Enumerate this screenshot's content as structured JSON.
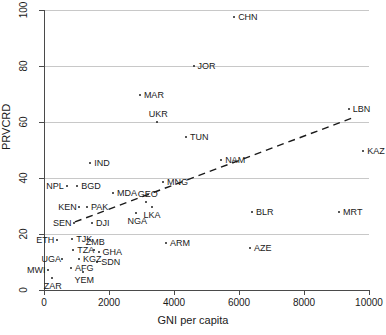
{
  "chart_data": {
    "type": "scatter",
    "title": "",
    "xlabel": "GNI per capita",
    "ylabel": "PRVCRD",
    "xlim": [
      0,
      10000
    ],
    "ylim": [
      0,
      100
    ],
    "xticks": [
      "0",
      "2000",
      "4000",
      "6000",
      "8000",
      "10000"
    ],
    "xtick_values": [
      0,
      2000,
      4000,
      6000,
      8000,
      10000
    ],
    "yticks": [
      "0",
      "20",
      "40",
      "60",
      "80",
      "100"
    ],
    "ytick_values": [
      0,
      20,
      40,
      60,
      80,
      100
    ],
    "grid": "horizontal",
    "legend": "none",
    "points": [
      {
        "label": "CHN",
        "x": 5850,
        "y": 97.5,
        "label_pos": "right"
      },
      {
        "label": "JOR",
        "x": 4600,
        "y": 80.0,
        "label_pos": "right"
      },
      {
        "label": "MAR",
        "x": 2950,
        "y": 69.5,
        "label_pos": "right"
      },
      {
        "label": "UKR",
        "x": 3480,
        "y": 60.0,
        "label_pos": "above"
      },
      {
        "label": "TUN",
        "x": 4370,
        "y": 54.5,
        "label_pos": "right"
      },
      {
        "label": "LBN",
        "x": 9380,
        "y": 64.5,
        "label_pos": "right"
      },
      {
        "label": "KAZ",
        "x": 9820,
        "y": 49.5,
        "label_pos": "right"
      },
      {
        "label": "IND",
        "x": 1420,
        "y": 45.5,
        "label_pos": "right"
      },
      {
        "label": "NAM",
        "x": 5450,
        "y": 46.5,
        "label_pos": "right"
      },
      {
        "label": "MNG",
        "x": 3660,
        "y": 38.5,
        "label_pos": "right"
      },
      {
        "label": "NPL",
        "x": 710,
        "y": 37.0,
        "label_pos": "left"
      },
      {
        "label": "BGD",
        "x": 1020,
        "y": 37.0,
        "label_pos": "right"
      },
      {
        "label": "MDA",
        "x": 2120,
        "y": 34.5,
        "label_pos": "right"
      },
      {
        "label": "GEO",
        "x": 3140,
        "y": 31.5,
        "label_pos": "above"
      },
      {
        "label": "LKA",
        "x": 3320,
        "y": 29.5,
        "label_pos": "below"
      },
      {
        "label": "KEN",
        "x": 1080,
        "y": 29.5,
        "label_pos": "left"
      },
      {
        "label": "PAK",
        "x": 1320,
        "y": 29.5,
        "label_pos": "right"
      },
      {
        "label": "NGA",
        "x": 2830,
        "y": 27.5,
        "label_pos": "below"
      },
      {
        "label": "SEN",
        "x": 920,
        "y": 24.0,
        "label_pos": "left"
      },
      {
        "label": "DJI",
        "x": 1480,
        "y": 24.0,
        "label_pos": "right"
      },
      {
        "label": "BLR",
        "x": 6400,
        "y": 27.8,
        "label_pos": "right"
      },
      {
        "label": "MRT",
        "x": 9080,
        "y": 27.8,
        "label_pos": "right"
      },
      {
        "label": "ETH",
        "x": 400,
        "y": 17.8,
        "label_pos": "left"
      },
      {
        "label": "TJK",
        "x": 870,
        "y": 18.2,
        "label_pos": "right"
      },
      {
        "label": "ARM",
        "x": 3750,
        "y": 16.8,
        "label_pos": "right"
      },
      {
        "label": "TZA",
        "x": 900,
        "y": 14.2,
        "label_pos": "right"
      },
      {
        "label": "ZMB",
        "x": 1540,
        "y": 14.2,
        "label_pos": "above"
      },
      {
        "label": "GHA",
        "x": 1680,
        "y": 13.5,
        "label_pos": "right"
      },
      {
        "label": "AZE",
        "x": 6340,
        "y": 15.0,
        "label_pos": "right"
      },
      {
        "label": "UGA",
        "x": 560,
        "y": 11.0,
        "label_pos": "left"
      },
      {
        "label": "KGZ",
        "x": 1080,
        "y": 11.0,
        "label_pos": "right"
      },
      {
        "label": "SDN",
        "x": 1640,
        "y": 10.0,
        "label_pos": "right"
      },
      {
        "label": "AFG",
        "x": 830,
        "y": 7.8,
        "label_pos": "right"
      },
      {
        "label": "MWI",
        "x": 120,
        "y": 7.2,
        "label_pos": "left"
      },
      {
        "label": "YEM",
        "x": 1200,
        "y": 6.5,
        "label_pos": "below"
      },
      {
        "label": "ZAR",
        "x": 250,
        "y": 4.2,
        "label_pos": "below"
      }
    ],
    "trend_line": {
      "style": "dashed",
      "x_start": 950,
      "y_start": 24.3,
      "x_end": 9570,
      "y_end": 61.8
    }
  }
}
